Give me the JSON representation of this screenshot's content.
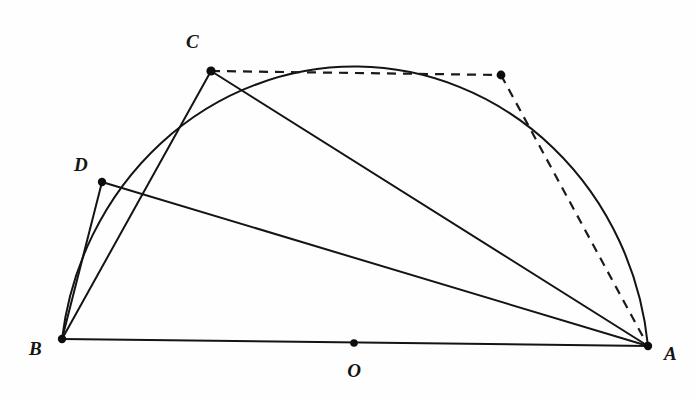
{
  "figure": {
    "type": "euclidean-geometry-diagram",
    "background_color": "#fefefe",
    "ink_color": "#141414",
    "width": 698,
    "height": 398
  },
  "points": [
    {
      "id": "A",
      "label": "A",
      "x": 648,
      "y": 346,
      "label_x": 664,
      "label_y": 360,
      "dot_r": 4.2,
      "labeled": true
    },
    {
      "id": "B",
      "label": "B",
      "x": 62,
      "y": 339,
      "label_x": 29,
      "label_y": 355,
      "dot_r": 4.2,
      "labeled": true
    },
    {
      "id": "C",
      "label": "C",
      "x": 211,
      "y": 71,
      "label_x": 186,
      "label_y": 48,
      "dot_r": 4.6,
      "labeled": true
    },
    {
      "id": "D",
      "label": "D",
      "x": 102,
      "y": 182,
      "label_x": 74,
      "label_y": 171,
      "dot_r": 4.2,
      "labeled": true
    },
    {
      "id": "O",
      "label": "O",
      "x": 354,
      "y": 343,
      "label_x": 354,
      "label_y": 377,
      "dot_r": 3.8,
      "labeled": true
    },
    {
      "id": "E",
      "label": "",
      "x": 501,
      "y": 75,
      "label_x": 0,
      "label_y": 0,
      "dot_r": 4.4,
      "labeled": false
    }
  ],
  "arc": {
    "name": "semicircle-arc-BA",
    "from": "B",
    "to": "A",
    "rx": 295,
    "ry": 312,
    "x_axis_rotation": 0,
    "large_arc": 0,
    "sweep": 1,
    "stroke_width": 2.0
  },
  "segments": [
    {
      "name": "segment-BA-diameter",
      "from": "B",
      "to": "A",
      "style": "solid",
      "stroke_width": 2.0
    },
    {
      "name": "segment-BC",
      "from": "B",
      "to": "C",
      "style": "solid",
      "stroke_width": 2.0
    },
    {
      "name": "segment-BD",
      "from": "B",
      "to": "D",
      "style": "solid",
      "stroke_width": 2.0
    },
    {
      "name": "segment-CA",
      "from": "C",
      "to": "A",
      "style": "solid",
      "stroke_width": 2.0
    },
    {
      "name": "segment-DA",
      "from": "D",
      "to": "A",
      "style": "solid",
      "stroke_width": 2.0
    },
    {
      "name": "segment-CE-dashed",
      "from": "C",
      "to": "E",
      "style": "dashed",
      "stroke_width": 2.2,
      "dash_pattern": "9,7"
    },
    {
      "name": "segment-EA-dashed",
      "from": "E",
      "to": "A",
      "style": "dashed",
      "stroke_width": 2.2,
      "dash_pattern": "9,7"
    }
  ]
}
